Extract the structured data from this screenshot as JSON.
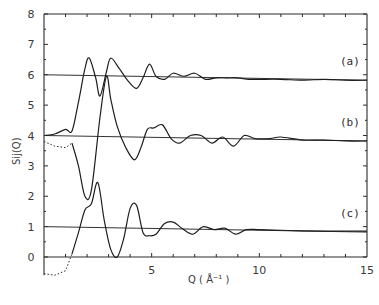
{
  "chart_data": {
    "type": "line",
    "title": "",
    "xlabel": "Q  ( Å⁻¹ )",
    "ylabel": "Sij(Q)",
    "xlim": [
      0,
      15
    ],
    "ylim": [
      -0.6,
      8
    ],
    "grid": false,
    "x_ticks": [
      5,
      10,
      15
    ],
    "x_tick_labels": [
      "5",
      "10",
      "15"
    ],
    "y_ticks": [
      0,
      1,
      2,
      3,
      4,
      5,
      6,
      7,
      8
    ],
    "y_tick_labels": [
      "0",
      "1",
      "2",
      "3",
      "4",
      "5",
      "6",
      "7",
      "8"
    ],
    "legend": {
      "position": "inline-right",
      "entries": [
        "(a)",
        "(b)",
        "(c)"
      ]
    },
    "series": [
      {
        "name": "(a)",
        "offset": 5,
        "baseline": 6.0,
        "x": [
          0.0,
          0.5,
          1.0,
          1.3,
          1.6,
          1.9,
          2.1,
          2.4,
          2.6,
          2.9,
          3.1,
          3.5,
          3.9,
          4.3,
          4.6,
          4.9,
          5.2,
          5.6,
          6.0,
          6.5,
          7.0,
          7.5,
          8.0,
          8.5,
          9.0,
          9.5,
          10.0,
          11.0,
          12.0,
          13.0,
          14.0,
          15.0
        ],
        "y": [
          4.0,
          4.05,
          4.2,
          4.15,
          5.1,
          6.2,
          6.55,
          5.9,
          5.3,
          6.1,
          6.55,
          6.2,
          5.8,
          5.55,
          5.9,
          6.35,
          5.95,
          5.85,
          6.05,
          5.95,
          6.05,
          5.85,
          5.9,
          5.9,
          5.9,
          5.85,
          5.85,
          5.85,
          5.82,
          5.85,
          5.82,
          5.82
        ]
      },
      {
        "name": "(b)",
        "offset": 3,
        "baseline": 4.0,
        "x": [
          0.0,
          0.5,
          1.0,
          1.3,
          1.6,
          1.9,
          2.2,
          2.6,
          2.9,
          3.1,
          3.4,
          3.8,
          4.2,
          4.5,
          4.8,
          5.1,
          5.5,
          5.9,
          6.3,
          6.8,
          7.3,
          7.8,
          8.3,
          8.8,
          9.3,
          9.8,
          10.5,
          11.0,
          12.0,
          13.0,
          14.0,
          15.0
        ],
        "y": [
          3.8,
          3.65,
          3.6,
          3.75,
          3.0,
          2.0,
          2.2,
          4.6,
          5.95,
          5.2,
          4.3,
          3.6,
          3.2,
          3.6,
          4.2,
          4.25,
          4.35,
          3.9,
          3.75,
          4.0,
          4.0,
          3.75,
          3.95,
          3.65,
          4.0,
          3.9,
          3.9,
          3.95,
          3.85,
          3.85,
          3.82,
          3.82
        ]
      },
      {
        "name": "(c)",
        "offset": 0,
        "baseline": 1.0,
        "x": [
          0.0,
          0.5,
          1.0,
          1.3,
          1.6,
          1.9,
          2.2,
          2.5,
          2.8,
          3.1,
          3.4,
          3.7,
          4.0,
          4.3,
          4.6,
          4.9,
          5.2,
          5.6,
          6.0,
          6.4,
          6.9,
          7.4,
          7.9,
          8.4,
          8.9,
          9.4,
          10.0,
          11.0,
          12.0,
          13.0,
          14.0,
          15.0
        ],
        "y": [
          -0.55,
          -0.6,
          -0.45,
          0.1,
          0.8,
          1.55,
          1.75,
          2.45,
          1.2,
          0.25,
          0.0,
          0.6,
          1.6,
          1.7,
          0.8,
          0.7,
          0.75,
          1.1,
          1.15,
          0.95,
          0.75,
          1.0,
          0.9,
          0.95,
          0.75,
          0.9,
          0.9,
          0.88,
          0.86,
          0.85,
          0.85,
          0.85
        ]
      }
    ],
    "annotations": [
      "dotted low-Q extrapolation on curves (b) and (c)"
    ]
  }
}
